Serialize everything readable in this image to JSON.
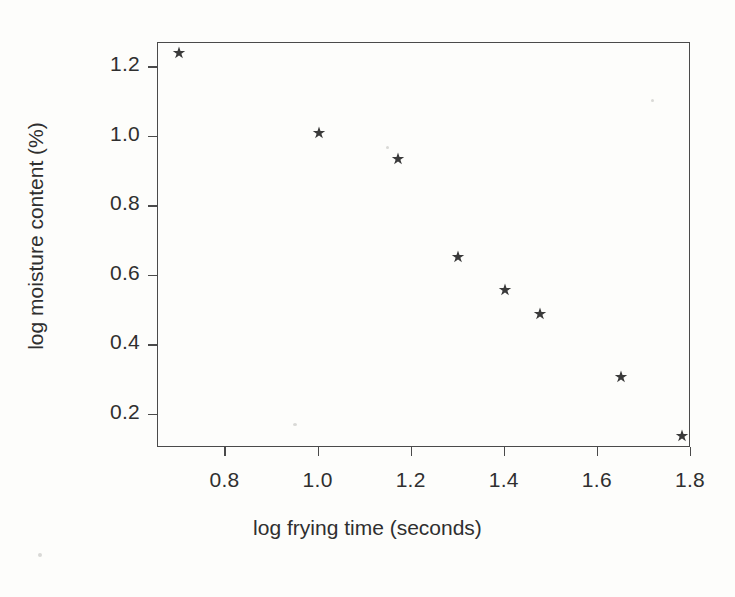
{
  "chart_data": {
    "type": "scatter",
    "title": "",
    "xlabel": "log frying time (seconds)",
    "ylabel": "log moisture content (%)",
    "xlim": [
      0.655,
      1.8
    ],
    "ylim": [
      0.105,
      1.27
    ],
    "grid": false,
    "legend": null,
    "marker": "star",
    "marker_color": "#3a3a3a",
    "xticks": [
      "0.8",
      "1.0",
      "1.2",
      "1.4",
      "1.6",
      "1.8"
    ],
    "xtick_values": [
      0.8,
      1.0,
      1.2,
      1.4,
      1.6,
      1.8
    ],
    "yticks": [
      "1.2",
      "1.0",
      "0.8",
      "0.6",
      "0.4",
      "0.2"
    ],
    "ytick_values": [
      1.2,
      1.0,
      0.8,
      0.6,
      0.4,
      0.2
    ],
    "x": [
      0.7,
      1.0,
      1.17,
      1.3,
      1.4,
      1.475,
      1.65,
      1.78
    ],
    "y": [
      1.24,
      1.01,
      0.935,
      0.655,
      0.56,
      0.49,
      0.31,
      0.14
    ],
    "points": [
      {
        "x": 0.7,
        "y": 1.24
      },
      {
        "x": 1.0,
        "y": 1.01
      },
      {
        "x": 1.17,
        "y": 0.935
      },
      {
        "x": 1.3,
        "y": 0.655
      },
      {
        "x": 1.4,
        "y": 0.56
      },
      {
        "x": 1.475,
        "y": 0.49
      },
      {
        "x": 1.65,
        "y": 0.31
      },
      {
        "x": 1.78,
        "y": 0.14
      }
    ]
  }
}
